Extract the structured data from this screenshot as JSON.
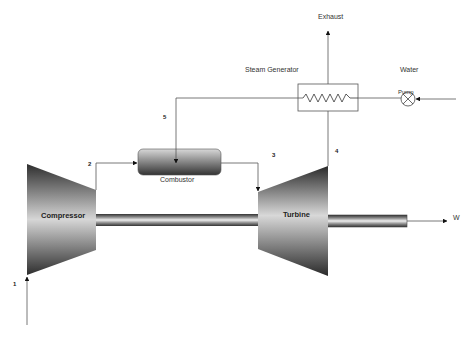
{
  "diagram": {
    "title": "",
    "components": {
      "compressor": {
        "label": "Compressor"
      },
      "turbine": {
        "label": "Turbine"
      },
      "combustor": {
        "label": "Combustor"
      },
      "steam_generator": {
        "label": "Steam Generator"
      },
      "pump": {
        "label": "Pump"
      }
    },
    "streams": {
      "exhaust": "Exhaust",
      "water": "Water",
      "work": "W"
    },
    "state_points": [
      "1",
      "2",
      "3",
      "4",
      "5"
    ],
    "colors": {
      "line": "#555555",
      "body_dark": "#2a2a2a",
      "body_light": "#dcdcdc",
      "background": "#ffffff"
    }
  }
}
